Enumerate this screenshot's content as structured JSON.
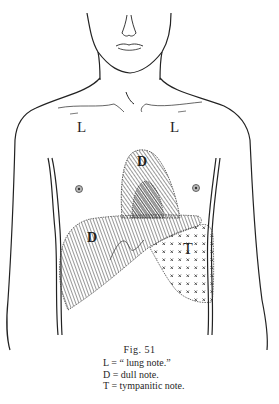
{
  "figure": {
    "title": "Fig. 51",
    "region_labels": {
      "lung_left": "L",
      "lung_right": "L",
      "heart_dull": "D",
      "liver_dull": "D",
      "stomach_tympanitic": "T"
    },
    "legend": [
      {
        "key": "L",
        "text": "L = “ lung note.”"
      },
      {
        "key": "D",
        "text": "D = dull note."
      },
      {
        "key": "T",
        "text": "T = tympanitic note."
      }
    ]
  }
}
